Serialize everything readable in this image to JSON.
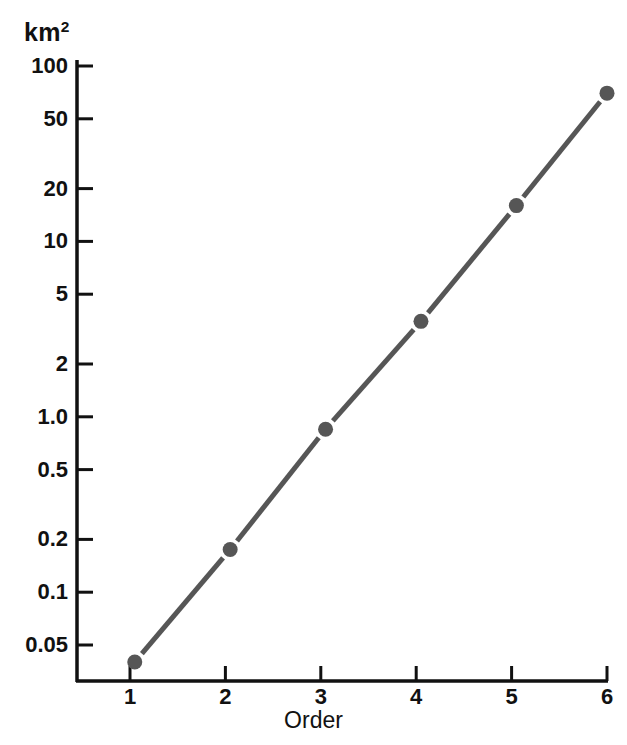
{
  "chart_data": {
    "type": "line",
    "title": "",
    "ylabel": "km2",
    "ylabel_display": "km",
    "ylabel_superscript": "2",
    "xlabel": "Order",
    "x": [
      1.05,
      2.05,
      3.05,
      4.05,
      5.05,
      6.0
    ],
    "values": [
      0.04,
      0.175,
      0.85,
      3.5,
      16,
      70
    ],
    "series": [
      {
        "name": "Mean basin area",
        "values": [
          0.04,
          0.175,
          0.85,
          3.5,
          16,
          70
        ]
      }
    ],
    "xticks": [
      1,
      2,
      3,
      4,
      5,
      6
    ],
    "xticklabels": [
      "1",
      "2",
      "3",
      "4",
      "5",
      "6"
    ],
    "xlim": [
      0.6,
      6.0
    ],
    "yscale": "log",
    "ylim": [
      0.032,
      125
    ],
    "yticks": [
      100,
      50,
      20,
      10,
      5,
      2,
      1.0,
      0.5,
      0.2,
      0.1,
      0.05
    ],
    "yticklabels": [
      "100",
      "50",
      "20",
      "10",
      "5",
      "2",
      "1.0",
      "0.5",
      "0.2",
      "0.1",
      "0.05"
    ],
    "grid": false,
    "legend": "none",
    "marker": "circle",
    "line_color": "#565656",
    "marker_color": "#565656",
    "axis_color": "#111111"
  }
}
